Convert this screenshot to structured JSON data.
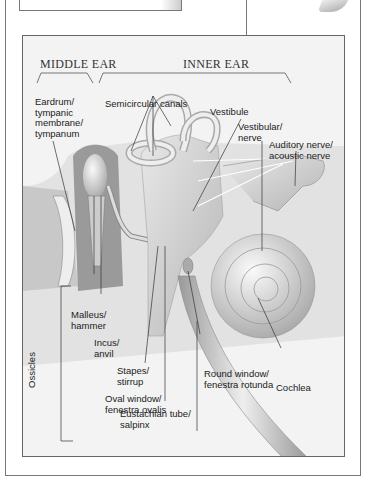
{
  "diagram": {
    "section_titles": {
      "middle_ear": "MIDDLE EAR",
      "inner_ear": "INNER EAR"
    },
    "labels": {
      "eardrum": "Eardrum/\ntympanic\nmembrane/\ntympanum",
      "semicircular_canals": "Semicircular canals",
      "vestibule": "Vestibule",
      "vestibular_nerve": "Vestibular/\nnerve",
      "auditory_nerve": "Auditory nerve/\nacoustic nerve",
      "malleus": "Malleus/\nhammer",
      "incus": "Incus/\nanvil",
      "stapes": "Stapes/\nstirrup",
      "oval_window": "Oval window/\nfenestra ovalis",
      "round_window": "Round window/\nfenestra rotunda",
      "cochlea": "Cochlea",
      "eustachian_tube": "Eustachian tube/\nsalpinx",
      "ossicles": "Ossicles"
    }
  }
}
